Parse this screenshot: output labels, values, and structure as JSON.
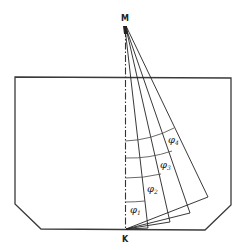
{
  "diagram": {
    "points": {
      "top": "M",
      "bottom": "K"
    },
    "angles": [
      {
        "symbol": "φ",
        "index": "1"
      },
      {
        "symbol": "φ",
        "index": "2"
      },
      {
        "symbol": "φ",
        "index": "3"
      },
      {
        "symbol": "φ",
        "index": "4"
      }
    ],
    "colors": {
      "stroke": "#222222",
      "background": "#ffffff"
    }
  }
}
